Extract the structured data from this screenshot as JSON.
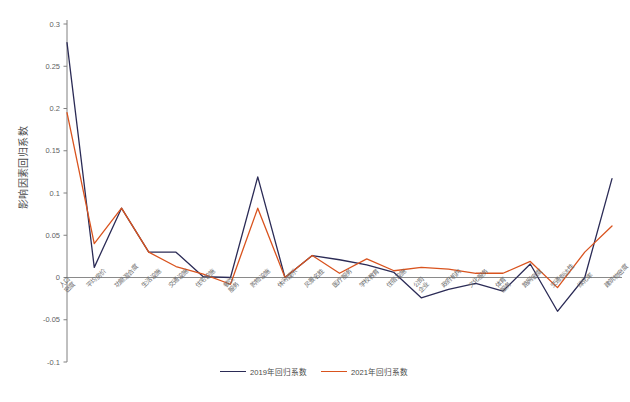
{
  "chart_data": {
    "type": "line",
    "title": "",
    "xlabel": "",
    "ylabel": "影响因素回归系数",
    "ylim": [
      -0.1,
      0.3
    ],
    "ytick_values": [
      0.3,
      0.25,
      0.2,
      0.15,
      0.1,
      0.05,
      0,
      -0.05,
      -0.1
    ],
    "ytick_labels": [
      "0.3",
      "0.25",
      "0.2",
      "0.15",
      "0.1",
      "0.05",
      "0",
      "-0.05",
      "-0.1"
    ],
    "grid": false,
    "legend_position": "bottom-center",
    "zero_line": true,
    "categories": [
      "人口\n密度",
      "平均房价",
      "功能混合度",
      "生活设施",
      "交通设施",
      "住宅设施",
      "餐饮\n服务",
      "购物设施",
      "休闲娱乐",
      "风景名胜",
      "医疗服务",
      "学校教育",
      "住宿设施",
      "公司\n企业",
      "政府机构",
      "文化服务",
      "体育\n服务",
      "路网密度",
      "交通到达性",
      "绿化率",
      "建筑物密度"
    ],
    "series": [
      {
        "name": "2019年回归系数",
        "color": "#2b2b56",
        "values": [
          0.278,
          0.012,
          0.082,
          0.03,
          0.03,
          0.001,
          0.0,
          0.119,
          0.0,
          0.026,
          0.021,
          0.015,
          0.006,
          -0.024,
          -0.014,
          -0.007,
          -0.016,
          0.016,
          -0.04,
          0.0,
          0.117
        ]
      },
      {
        "name": "2021年回归系数",
        "color": "#d9531e",
        "values": [
          0.195,
          0.04,
          0.082,
          0.03,
          0.013,
          0.004,
          -0.008,
          0.082,
          0.0,
          0.026,
          0.005,
          0.022,
          0.008,
          0.012,
          0.01,
          0.005,
          0.005,
          0.019,
          -0.012,
          0.03,
          0.061
        ]
      }
    ]
  },
  "legend": {
    "entries": [
      {
        "label": "2019年回归系数",
        "color": "#2b2b56"
      },
      {
        "label": "2021年回归系数",
        "color": "#d9531e"
      }
    ]
  },
  "axes": {
    "y_title": "影响因素回归系数"
  },
  "caption": {
    "text": ""
  },
  "colors": {
    "series_2019": "#2b2b56",
    "series_2021": "#d9531e",
    "axis": "#808080",
    "tick_text": "#5f5f5f",
    "background": "#ffffff"
  }
}
